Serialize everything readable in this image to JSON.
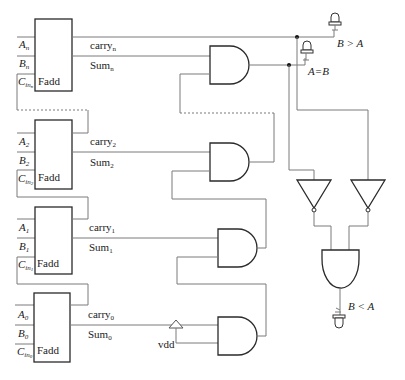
{
  "diagram": {
    "type": "n-bit comparator circuit using full adders",
    "adders": [
      {
        "index": "n",
        "a_label": "A",
        "a_sub": "n",
        "b_label": "B",
        "b_sub": "n",
        "cin_label": "C",
        "cin_sub": "in",
        "cin_sub2": "n",
        "block_label": "Fadd",
        "carry_label": "carry",
        "carry_sub": "n",
        "sum_label": "Sum",
        "sum_sub": "n"
      },
      {
        "index": "2",
        "a_label": "A",
        "a_sub": "2",
        "b_label": "B",
        "b_sub": "2",
        "cin_label": "C",
        "cin_sub": "in",
        "cin_sub2": "2",
        "block_label": "Fadd",
        "carry_label": "carry",
        "carry_sub": "2",
        "sum_label": "Sum",
        "sum_sub": "2"
      },
      {
        "index": "1",
        "a_label": "A",
        "a_sub": "1",
        "b_label": "B",
        "b_sub": "1",
        "cin_label": "C",
        "cin_sub": "in",
        "cin_sub2": "1",
        "block_label": "Fadd",
        "carry_label": "carry",
        "carry_sub": "1",
        "sum_label": "Sum",
        "sum_sub": "1"
      },
      {
        "index": "0",
        "a_label": "A",
        "a_sub": "0",
        "b_label": "B",
        "b_sub": "0",
        "cin_label": "C",
        "cin_sub": "in",
        "cin_sub2": "0",
        "block_label": "Fadd",
        "carry_label": "carry",
        "carry_sub": "0",
        "sum_label": "Sum",
        "sum_sub": "0"
      }
    ],
    "supply_label": "vdd",
    "outputs": {
      "greater": "B > A",
      "equal": "A=B",
      "less": "B < A"
    },
    "gates": {
      "and_chain": 4,
      "inverters": 2,
      "final_and": 1
    }
  }
}
